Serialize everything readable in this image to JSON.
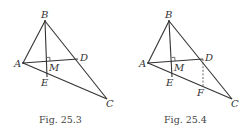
{
  "figures": [
    {
      "caption": "Fig. 25.3",
      "points": {
        "A": {
          "label": "A",
          "x": 23,
          "y": 63
        },
        "B": {
          "label": "B",
          "x": 45,
          "y": 21
        },
        "C": {
          "label": "C",
          "x": 107,
          "y": 99
        },
        "D": {
          "label": "D",
          "x": 78,
          "y": 59
        },
        "M": {
          "label": "M",
          "x": 47,
          "y": 61
        },
        "E": {
          "label": "E",
          "x": 47,
          "y": 77
        }
      },
      "segments": [
        "AB",
        "BC",
        "AC",
        "AD",
        "BE"
      ],
      "right_angle_at": "M"
    },
    {
      "caption": "Fig. 25.4",
      "points": {
        "A": {
          "label": "A",
          "x": 148,
          "y": 63
        },
        "B": {
          "label": "B",
          "x": 169,
          "y": 21
        },
        "C": {
          "label": "C",
          "x": 232,
          "y": 99
        },
        "D": {
          "label": "D",
          "x": 203,
          "y": 59
        },
        "M": {
          "label": "M",
          "x": 172,
          "y": 61
        },
        "E": {
          "label": "E",
          "x": 172,
          "y": 77
        },
        "F": {
          "label": "F",
          "x": 203,
          "y": 87
        }
      },
      "segments": [
        "AB",
        "BC",
        "AC",
        "AD",
        "BE"
      ],
      "dashed_segments": [
        "DF"
      ],
      "right_angle_at": "M"
    }
  ]
}
